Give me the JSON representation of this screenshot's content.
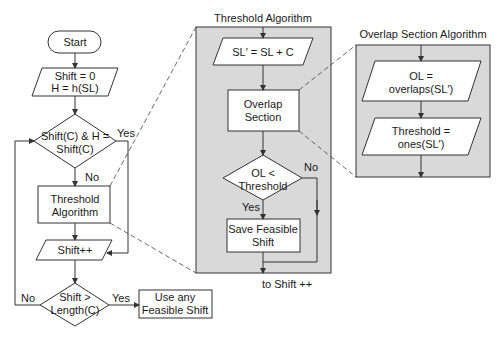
{
  "colors": {
    "panel": "#d9d9d9",
    "stroke": "#333333",
    "box": "#ffffff"
  },
  "main": {
    "start": "Start",
    "init_line1": "Shift = 0",
    "init_line2": "H = h(SL)",
    "decision1_line1": "Shift(C) & H =",
    "decision1_line2": "Shift(C)",
    "decision1_yes": "Yes",
    "decision1_no": "No",
    "threshold_line1": "Threshold",
    "threshold_line2": "Algorithm",
    "increment": "Shift++",
    "decision2_line1": "Shift >",
    "decision2_line2": "Length(C)",
    "decision2_yes": "Yes",
    "decision2_no": "No",
    "result_line1": "Use any",
    "result_line2": "Feasible Shift"
  },
  "threshold_panel": {
    "title": "Threshold Algorithm",
    "step1": "SL′ = SL + C",
    "overlap_line1": "Overlap",
    "overlap_line2": "Section",
    "decision_line1": "OL <",
    "decision_line2": "Threshold",
    "decision_yes": "Yes",
    "decision_no": "No",
    "save_line1": "Save Feasible",
    "save_line2": "Shift",
    "exit_label": "to Shift ++"
  },
  "overlap_panel": {
    "title": "Overlap Section Algorithm",
    "step1_line1": "OL =",
    "step1_line2": "overlaps(SL′)",
    "step2_line1": "Threshold =",
    "step2_line2": "ones(SL′)"
  }
}
